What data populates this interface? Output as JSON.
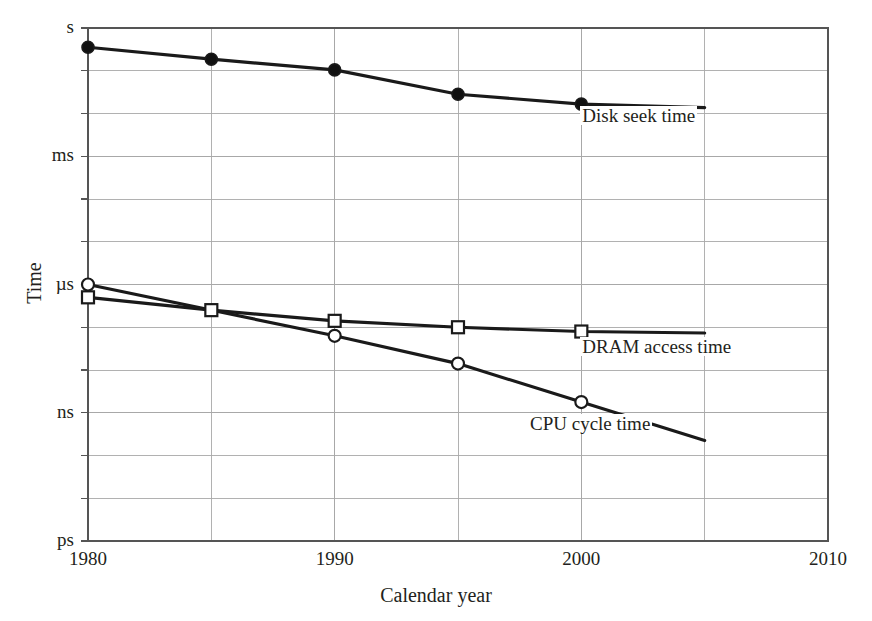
{
  "chart_data": {
    "type": "line",
    "title": "",
    "xlabel": "Calendar year",
    "ylabel": "Time",
    "xlim": [
      1980,
      2010
    ],
    "ylim_decades": [
      -12,
      0
    ],
    "y_scale": "log",
    "grid": true,
    "legend_position": "inline-annotations",
    "x_ticks": [
      "1980",
      "1990",
      "2000",
      "2010"
    ],
    "x_tick_values": [
      1980,
      1990,
      2000,
      2010
    ],
    "x_minor_gridlines": [
      1985,
      1995,
      2005
    ],
    "y_ticks": [
      "s",
      "ms",
      "µs",
      "ns",
      "ps"
    ],
    "y_tick_exponents": [
      0,
      -3,
      -6,
      -9,
      -12
    ],
    "series": [
      {
        "name": "Disk seek time",
        "marker": "filled-circle",
        "x": [
          1980,
          1985,
          1990,
          1995,
          2000
        ],
        "y_exponents": [
          -0.45,
          -0.73,
          -0.98,
          -1.55,
          -1.78
        ],
        "line_end_x": 2005
      },
      {
        "name": "DRAM access time",
        "marker": "open-square",
        "x": [
          1980,
          1985,
          1990,
          1995,
          2000
        ],
        "y_exponents": [
          -6.3,
          -6.6,
          -6.85,
          -7.0,
          -7.1
        ],
        "line_end_x": 2005
      },
      {
        "name": "CPU cycle time",
        "marker": "open-circle",
        "x": [
          1980,
          1990,
          1995,
          2000
        ],
        "y_exponents": [
          -6.0,
          -7.2,
          -7.85,
          -8.75
        ],
        "line_end_x": 2005
      }
    ],
    "annotations": [
      {
        "text": "Disk seek time",
        "x": 2000,
        "y_exponent": -2.1
      },
      {
        "text": "DRAM access time",
        "x": 2000,
        "y_exponent": -7.5
      },
      {
        "text": "CPU cycle time",
        "x": 1998,
        "y_exponent": -9.3
      }
    ],
    "colors": {
      "line": "#1a1a1a",
      "grid": "#a8a8a8",
      "axis": "#555555",
      "background": "#ffffff",
      "marker_fill_open": "#ffffff",
      "marker_fill_solid": "#111111"
    }
  },
  "axes": {
    "y_title": "Time",
    "x_title": "Calendar year",
    "y_tick_labels": [
      "s",
      "ms",
      "µs",
      "ns",
      "ps"
    ],
    "x_tick_labels": [
      "1980",
      "1990",
      "2000",
      "2010"
    ]
  },
  "annotations": {
    "disk": "Disk seek time",
    "dram": "DRAM access time",
    "cpu": "CPU cycle time"
  }
}
